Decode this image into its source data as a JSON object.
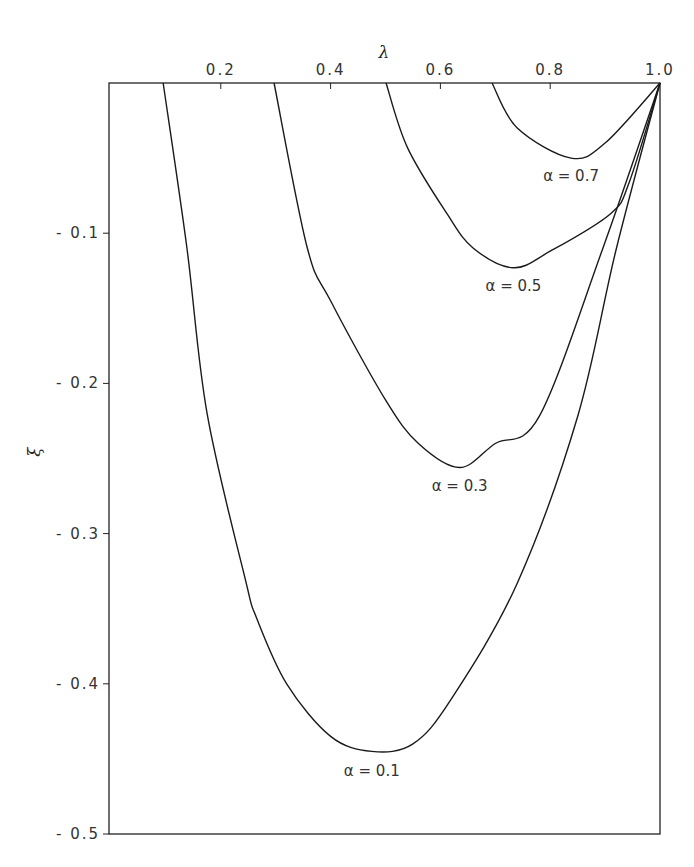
{
  "chart_data": {
    "type": "line",
    "title": "",
    "xlabel": "λ",
    "ylabel": "ξ",
    "xlim": [
      0,
      1.0
    ],
    "ylim": [
      -0.5,
      0
    ],
    "x_axis_position": "top",
    "grid": false,
    "x_ticks": [
      "0.2",
      "0.4",
      "0.6",
      "0.8",
      "1.0"
    ],
    "y_ticks": [
      "-0.1",
      "-0.2",
      "-0.3",
      "-0.4",
      "-0.5"
    ],
    "series": [
      {
        "name": "α = 0.1",
        "x": [
          0.095,
          0.138,
          0.175,
          0.245,
          0.265,
          0.32,
          0.4,
          0.475,
          0.55,
          0.62,
          0.74,
          0.85,
          0.92,
          1.0
        ],
        "y": [
          0,
          -0.109,
          -0.22,
          -0.331,
          -0.356,
          -0.4,
          -0.435,
          -0.445,
          -0.44,
          -0.41,
          -0.333,
          -0.222,
          -0.111,
          0
        ]
      },
      {
        "name": "α = 0.3",
        "x": [
          0.297,
          0.357,
          0.4,
          0.5,
          0.56,
          0.635,
          0.7,
          0.78,
          0.895,
          1.0
        ],
        "y": [
          0,
          -0.109,
          -0.145,
          -0.211,
          -0.24,
          -0.256,
          -0.24,
          -0.222,
          -0.111,
          0
        ]
      },
      {
        "name": "α = 0.5",
        "x": [
          0.501,
          0.54,
          0.612,
          0.66,
          0.733,
          0.8,
          0.91,
          0.945,
          1.0
        ],
        "y": [
          0,
          -0.043,
          -0.087,
          -0.11,
          -0.123,
          -0.112,
          -0.087,
          -0.065,
          0
        ]
      },
      {
        "name": "α = 0.7",
        "x": [
          0.694,
          0.74,
          0.838,
          0.9,
          1.0
        ],
        "y": [
          0,
          -0.03,
          -0.05,
          -0.04,
          0
        ]
      }
    ],
    "annotations": [
      {
        "text": "α = 0.1",
        "x": 0.475,
        "y": -0.458
      },
      {
        "text": "α = 0.3",
        "x": 0.635,
        "y": -0.268
      },
      {
        "text": "α = 0.5",
        "x": 0.733,
        "y": -0.135
      },
      {
        "text": "α = 0.7",
        "x": 0.838,
        "y": -0.062
      }
    ]
  }
}
